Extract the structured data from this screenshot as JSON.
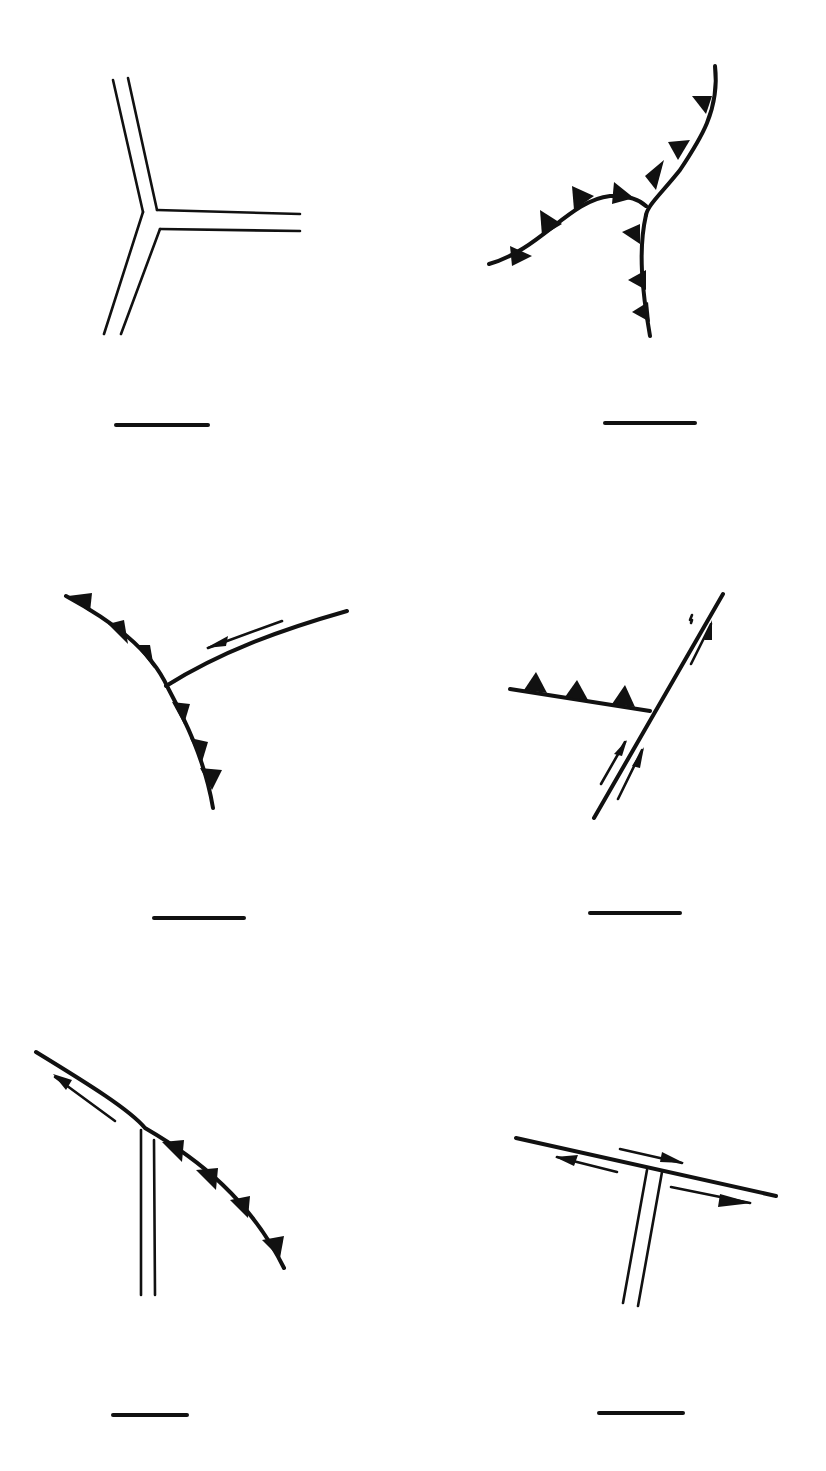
{
  "diagram": {
    "colors": {
      "ink": "#111111",
      "background": "#ffffff"
    },
    "legend_symbols": {
      "double_line": "ridge (spreading center)",
      "toothed_line": "trench (subduction zone)",
      "line_with_half_arrows": "transform fault"
    },
    "panels": [
      {
        "id": "A",
        "position": "top-left",
        "boundaries": [
          "ridge",
          "ridge",
          "ridge"
        ],
        "label": ""
      },
      {
        "id": "B",
        "position": "top-right",
        "boundaries": [
          "trench",
          "trench",
          "trench"
        ],
        "label": ""
      },
      {
        "id": "C",
        "position": "middle-left",
        "boundaries": [
          "trench",
          "trench",
          "transform"
        ],
        "label": ""
      },
      {
        "id": "D",
        "position": "middle-right",
        "boundaries": [
          "trench",
          "transform",
          "transform"
        ],
        "label": ""
      },
      {
        "id": "E",
        "position": "bottom-left",
        "boundaries": [
          "transform",
          "trench",
          "ridge"
        ],
        "label": ""
      },
      {
        "id": "F",
        "position": "bottom-right",
        "boundaries": [
          "transform",
          "transform",
          "ridge"
        ],
        "label": ""
      }
    ]
  }
}
